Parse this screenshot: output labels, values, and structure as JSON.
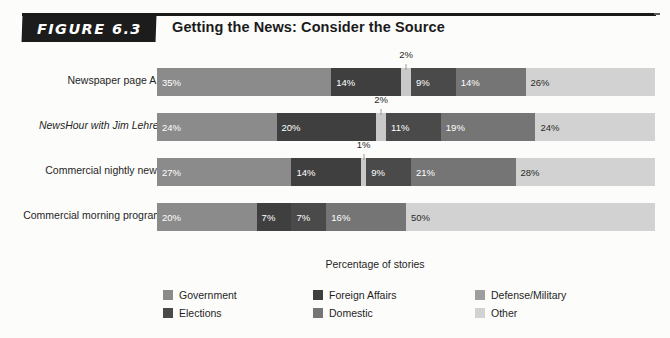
{
  "figure": {
    "tag": "FIGURE 6.3",
    "title": "Getting the News: Consider the Source"
  },
  "axis_caption": "Percentage of stories",
  "legend": {
    "items": [
      {
        "label": "Government",
        "color": "#8b8b8b"
      },
      {
        "label": "Elections",
        "color": "#4a4a4a"
      },
      {
        "label": "Foreign Affairs",
        "color": "#3f3f3f"
      },
      {
        "label": "Domestic",
        "color": "#757575"
      },
      {
        "label": "Defense/Military",
        "color": "#9e9e9e"
      },
      {
        "label": "Other",
        "color": "#d2d2d2"
      }
    ]
  },
  "chart_data": {
    "type": "bar",
    "orientation": "horizontal",
    "stacked": true,
    "normalized_percent": true,
    "title": "Getting the News: Consider the Source",
    "xlabel": "Percentage of stories",
    "ylabel": "",
    "xlim": [
      0,
      100
    ],
    "grid": false,
    "legend_position": "bottom",
    "categories": [
      "Newspaper page A1",
      "NewsHour with Jim Lehrer",
      "Commercial nightly news",
      "Commercial morning program"
    ],
    "series": [
      {
        "name": "Government",
        "color": "#8b8b8b",
        "values": [
          35,
          24,
          27,
          20
        ]
      },
      {
        "name": "Foreign Affairs",
        "color": "#3f3f3f",
        "values": [
          14,
          20,
          14,
          7
        ]
      },
      {
        "name": "Defense/Military",
        "color": "#c9c9c9",
        "values": [
          2,
          2,
          1,
          0
        ]
      },
      {
        "name": "Elections",
        "color": "#4a4a4a",
        "values": [
          9,
          11,
          9,
          7
        ]
      },
      {
        "name": "Domestic",
        "color": "#757575",
        "values": [
          14,
          19,
          21,
          16
        ]
      },
      {
        "name": "Other",
        "color": "#d2d2d2",
        "values": [
          26,
          24,
          28,
          50
        ]
      }
    ],
    "rows": [
      {
        "label": "Newspaper page A1",
        "italic": false,
        "callout": {
          "text": "2%",
          "series": "Defense/Military"
        },
        "segments": [
          {
            "series": "Government",
            "value": 35,
            "label": "35%",
            "color": "#8b8b8b",
            "light": false,
            "show_label": true
          },
          {
            "series": "Foreign Affairs",
            "value": 14,
            "label": "14%",
            "color": "#3f3f3f",
            "light": false,
            "show_label": true
          },
          {
            "series": "Defense/Military",
            "value": 2,
            "label": "2%",
            "color": "#c9c9c9",
            "light": true,
            "show_label": false
          },
          {
            "series": "Elections",
            "value": 9,
            "label": "9%",
            "color": "#4a4a4a",
            "light": false,
            "show_label": true
          },
          {
            "series": "Domestic",
            "value": 14,
            "label": "14%",
            "color": "#757575",
            "light": false,
            "show_label": true
          },
          {
            "series": "Other",
            "value": 26,
            "label": "26%",
            "color": "#d2d2d2",
            "light": true,
            "show_label": true
          }
        ]
      },
      {
        "label": "NewsHour with Jim Lehrer",
        "italic": true,
        "callout": {
          "text": "2%",
          "series": "Defense/Military"
        },
        "segments": [
          {
            "series": "Government",
            "value": 24,
            "label": "24%",
            "color": "#8b8b8b",
            "light": false,
            "show_label": true
          },
          {
            "series": "Foreign Affairs",
            "value": 20,
            "label": "20%",
            "color": "#3f3f3f",
            "light": false,
            "show_label": true
          },
          {
            "series": "Defense/Military",
            "value": 2,
            "label": "2%",
            "color": "#c9c9c9",
            "light": true,
            "show_label": false
          },
          {
            "series": "Elections",
            "value": 11,
            "label": "11%",
            "color": "#4a4a4a",
            "light": false,
            "show_label": true
          },
          {
            "series": "Domestic",
            "value": 19,
            "label": "19%",
            "color": "#757575",
            "light": false,
            "show_label": true
          },
          {
            "series": "Other",
            "value": 24,
            "label": "24%",
            "color": "#d2d2d2",
            "light": true,
            "show_label": true
          }
        ]
      },
      {
        "label": "Commercial nightly news",
        "italic": false,
        "callout": {
          "text": "1%",
          "series": "Defense/Military"
        },
        "segments": [
          {
            "series": "Government",
            "value": 27,
            "label": "27%",
            "color": "#8b8b8b",
            "light": false,
            "show_label": true
          },
          {
            "series": "Foreign Affairs",
            "value": 14,
            "label": "14%",
            "color": "#3f3f3f",
            "light": false,
            "show_label": true
          },
          {
            "series": "Defense/Military",
            "value": 1,
            "label": "1%",
            "color": "#c9c9c9",
            "light": true,
            "show_label": false
          },
          {
            "series": "Elections",
            "value": 9,
            "label": "9%",
            "color": "#4a4a4a",
            "light": false,
            "show_label": true
          },
          {
            "series": "Domestic",
            "value": 21,
            "label": "21%",
            "color": "#757575",
            "light": false,
            "show_label": true
          },
          {
            "series": "Other",
            "value": 28,
            "label": "28%",
            "color": "#d2d2d2",
            "light": true,
            "show_label": true
          }
        ]
      },
      {
        "label": "Commercial morning program",
        "italic": false,
        "callout": null,
        "segments": [
          {
            "series": "Government",
            "value": 20,
            "label": "20%",
            "color": "#8b8b8b",
            "light": false,
            "show_label": true
          },
          {
            "series": "Foreign Affairs",
            "value": 7,
            "label": "7%",
            "color": "#3f3f3f",
            "light": false,
            "show_label": true
          },
          {
            "series": "Elections",
            "value": 7,
            "label": "7%",
            "color": "#4a4a4a",
            "light": false,
            "show_label": true
          },
          {
            "series": "Domestic",
            "value": 16,
            "label": "16%",
            "color": "#757575",
            "light": false,
            "show_label": true
          },
          {
            "series": "Other",
            "value": 50,
            "label": "50%",
            "color": "#d2d2d2",
            "light": true,
            "show_label": true
          }
        ]
      }
    ]
  }
}
